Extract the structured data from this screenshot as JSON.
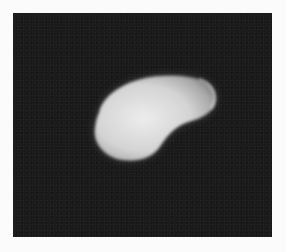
{
  "image": {
    "description": "Grayscale photograph of a single bright kidney-bean-shaped object on a dark background",
    "subject": "kidney-shaped specimen",
    "colors": {
      "page_background": "#fbfbfb",
      "frame_background": "#1b1b1b",
      "specimen_core": "#e6e6e6",
      "specimen_edge": "#9a9a9a"
    }
  }
}
